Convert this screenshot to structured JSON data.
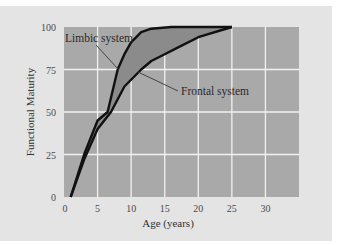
{
  "chart_data": {
    "type": "line",
    "title": "",
    "xlabel": "Age (years)",
    "ylabel": "Functional Maturity",
    "xlim": [
      0,
      35
    ],
    "ylim": [
      0,
      100
    ],
    "x_ticks": [
      "0",
      "5",
      "10",
      "15",
      "20",
      "25",
      "30"
    ],
    "y_ticks": [
      "0",
      "25",
      "50",
      "75",
      "100"
    ],
    "grid": true,
    "legend": "inline annotations",
    "series": [
      {
        "name": "Limbic system",
        "x": [
          1,
          3,
          5,
          6.5,
          8,
          9,
          10,
          11.5,
          13,
          16,
          20,
          25
        ],
        "values": [
          0,
          25,
          45,
          50,
          75,
          84,
          91,
          97,
          99,
          100,
          100,
          100
        ]
      },
      {
        "name": "Frontal system",
        "x": [
          1,
          3,
          5,
          7,
          9,
          11.5,
          13,
          15,
          17,
          20,
          25
        ],
        "values": [
          0,
          22,
          40,
          50,
          65,
          75,
          80,
          84,
          88,
          94,
          100
        ]
      }
    ],
    "shaded_region": "between Limbic system and Frontal system curves",
    "annotations": [
      {
        "text": "Limbic system",
        "points_to": "Limbic system curve at ~age 8"
      },
      {
        "text": "Frontal system",
        "points_to": "Frontal system curve at ~age 11"
      }
    ]
  },
  "colors": {
    "page_background": "#ffffff",
    "card_background": "#e4e4e4",
    "plot_background": "#a9a9a9",
    "gridlines": "#f2f2f2",
    "band_fill": "#8b8b8b",
    "curve_stroke": "#111111",
    "leader_line": "#3a3a3a"
  }
}
